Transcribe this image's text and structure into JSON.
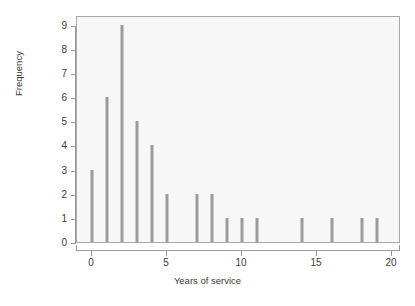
{
  "figure": {
    "top_sliver_text": "…",
    "page_background": "#ffffff",
    "panel_background": "#f7f7f7",
    "panel_border_color": "#a8a8a8",
    "bar_color": "#9b9b9b",
    "axis_color": "#9a9a9a",
    "text_color": "#3c3c3c"
  },
  "chart_data": {
    "type": "bar",
    "title": "",
    "subtitle": "",
    "xlabel": "Years of service",
    "ylabel": "Frequency",
    "categories": [
      0,
      1,
      2,
      3,
      4,
      5,
      6,
      7,
      8,
      9,
      10,
      11,
      12,
      13,
      14,
      15,
      16,
      17,
      18,
      19,
      20
    ],
    "values": [
      3,
      6,
      9,
      5,
      4,
      2,
      0,
      2,
      2,
      1,
      1,
      1,
      0,
      0,
      1,
      0,
      1,
      0,
      1,
      1,
      0
    ],
    "points": [
      {
        "x": 0,
        "y": 3
      },
      {
        "x": 1,
        "y": 6
      },
      {
        "x": 2,
        "y": 9
      },
      {
        "x": 3,
        "y": 5
      },
      {
        "x": 4,
        "y": 4
      },
      {
        "x": 5,
        "y": 2
      },
      {
        "x": 7,
        "y": 2
      },
      {
        "x": 8,
        "y": 2
      },
      {
        "x": 9,
        "y": 1
      },
      {
        "x": 10,
        "y": 1
      },
      {
        "x": 11,
        "y": 1
      },
      {
        "x": 14,
        "y": 1
      },
      {
        "x": 16,
        "y": 1
      },
      {
        "x": 18,
        "y": 1
      },
      {
        "x": 19,
        "y": 1
      }
    ],
    "xlim": [
      -1,
      20.6
    ],
    "ylim": [
      0,
      9.4
    ],
    "xticks": [
      0,
      5,
      10,
      15,
      20
    ],
    "xticklabels": [
      "0",
      "5",
      "10",
      "15",
      "20"
    ],
    "yticks": [
      0,
      1,
      2,
      3,
      4,
      5,
      6,
      7,
      8,
      9
    ],
    "yticklabels": [
      "0",
      "1",
      "2",
      "3",
      "4",
      "5",
      "6",
      "7",
      "8",
      "9"
    ],
    "grid": false,
    "legend": false,
    "legend_position": "none"
  }
}
